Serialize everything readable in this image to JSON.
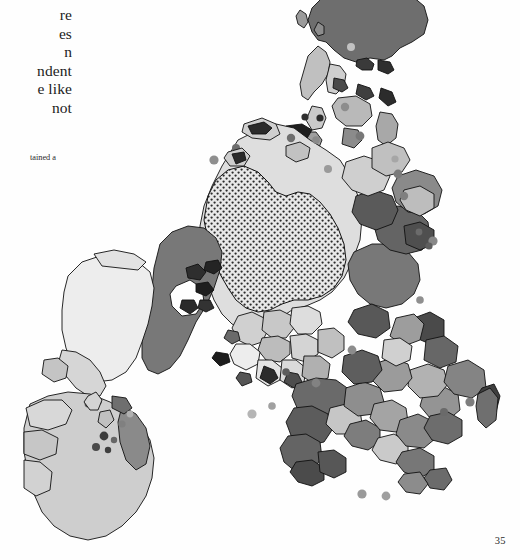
{
  "page": {
    "number": "35",
    "background_color": "#ffffff",
    "ink_color": "#1c1c1c"
  },
  "body_text": {
    "lines": [
      "re",
      "es",
      "n",
      "ndent",
      "e like",
      "not"
    ],
    "note": "Left margin of a scanned book page; lines are cropped at the binding edge."
  },
  "footnote": {
    "text": "tained a"
  },
  "map": {
    "title": "",
    "type": "choropleth",
    "projection_note": "rotated / cropped world map",
    "outline_color": "#111111",
    "ocean_color": "#ffffff",
    "legend_classes": [
      {
        "name": "class-very-light",
        "fill": "#efefef",
        "label": ""
      },
      {
        "name": "class-light",
        "fill": "#cfcfcf",
        "label": ""
      },
      {
        "name": "class-medium",
        "fill": "#a6a6a6",
        "label": ""
      },
      {
        "name": "class-dark",
        "fill": "#787878",
        "label": ""
      },
      {
        "name": "class-very-dark",
        "fill": "#555555",
        "label": ""
      },
      {
        "name": "class-stipple",
        "fill": "#dcdcdc",
        "label": ""
      }
    ],
    "regions": [
      {
        "id": "north-landmass-dark",
        "fill": "#6e6e6e"
      },
      {
        "id": "arctic-archipelago",
        "fill": "#cfcfcf"
      },
      {
        "id": "northern-continent-interior",
        "fill": "#dcdcdc"
      },
      {
        "id": "stippled-core",
        "fill": "#d8d8d8"
      },
      {
        "id": "western-continent-light",
        "fill": "#ececec"
      },
      {
        "id": "western-continent-dark",
        "fill": "#787878"
      },
      {
        "id": "southern-continent-light",
        "fill": "#cccccc"
      },
      {
        "id": "southern-continent-dark-band",
        "fill": "#5e5e5e"
      },
      {
        "id": "eastern-peninsulas",
        "fill": "#8f8f8f"
      },
      {
        "id": "island-arc",
        "fill": "#b4b4b4"
      }
    ],
    "island_dots": {
      "fill": "#9a9a9a",
      "fill_dark": "#4a4a4a",
      "fill_light": "#c4c4c4",
      "count": 34
    }
  }
}
